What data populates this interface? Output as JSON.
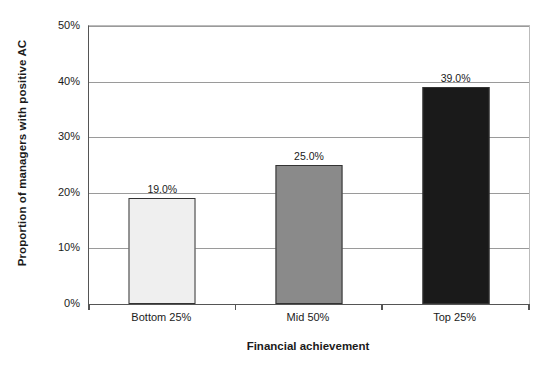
{
  "chart_data": {
    "type": "bar",
    "title": "",
    "subtitle": "",
    "xlabel": "Financial achievement",
    "ylabel": "Proportion of managers with positive AC",
    "categories": [
      "Bottom 25%",
      "Mid 50%",
      "Top 25%"
    ],
    "values": [
      19.0,
      25.0,
      39.0
    ],
    "data_labels": [
      "19.0%",
      "25.0%",
      "39.0%"
    ],
    "ylim": [
      0,
      50
    ],
    "ytick_values": [
      0,
      10,
      20,
      30,
      40,
      50
    ],
    "ytick_labels": [
      "0%",
      "10%",
      "20%",
      "30%",
      "40%",
      "50%"
    ],
    "grid": "horizontal",
    "legend": "none",
    "bar_colors": [
      "#efefef",
      "#8a8a8a",
      "#1a1a1a"
    ],
    "bar_border_color": "#333333",
    "gridline_color": "#9a9a9a",
    "axis_color": "#555555",
    "background_color": "#ffffff"
  }
}
